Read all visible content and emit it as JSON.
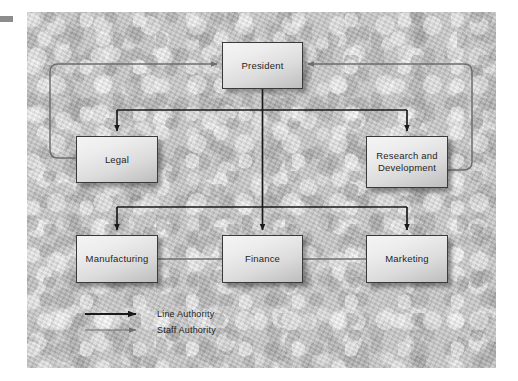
{
  "diagram": {
    "type": "organizational-chart",
    "background_color": "#c8c8c8",
    "box_border_color": "#3a3a3a",
    "line_authority_color": "#1a1a1a",
    "staff_authority_color": "#6e6e6e",
    "nodes": [
      {
        "id": "president",
        "label": "President",
        "level": 1,
        "x": 222,
        "y": 42,
        "w": 81,
        "h": 47
      },
      {
        "id": "legal",
        "label": "Legal",
        "level": 2,
        "x": 76,
        "y": 136,
        "w": 82,
        "h": 47
      },
      {
        "id": "rd",
        "label": "Research and\nDevelopment",
        "level": 2,
        "x": 366,
        "y": 136,
        "w": 82,
        "h": 52
      },
      {
        "id": "manufacturing",
        "label": "Manufacturing",
        "level": 3,
        "x": 76,
        "y": 235,
        "w": 82,
        "h": 48
      },
      {
        "id": "finance",
        "label": "Finance",
        "level": 3,
        "x": 222,
        "y": 235,
        "w": 81,
        "h": 48
      },
      {
        "id": "marketing",
        "label": "Marketing",
        "level": 3,
        "x": 366,
        "y": 235,
        "w": 82,
        "h": 48
      }
    ],
    "edges": [
      {
        "from": "president",
        "to": "legal",
        "authority": "line"
      },
      {
        "from": "president",
        "to": "rd",
        "authority": "line"
      },
      {
        "from": "president",
        "to": "manufacturing",
        "authority": "line"
      },
      {
        "from": "president",
        "to": "finance",
        "authority": "line"
      },
      {
        "from": "president",
        "to": "marketing",
        "authority": "line"
      },
      {
        "from": "legal",
        "to": "president",
        "authority": "staff"
      },
      {
        "from": "rd",
        "to": "president",
        "authority": "staff"
      },
      {
        "from": "manufacturing",
        "to": "finance",
        "authority": "staff"
      },
      {
        "from": "finance",
        "to": "marketing",
        "authority": "staff"
      }
    ]
  },
  "legend": {
    "items": [
      {
        "key": "line",
        "label": "Line Authority",
        "color": "#1a1a1a",
        "thickness": "thick"
      },
      {
        "key": "staff",
        "label": "Staff Authority",
        "color": "#6e6e6e",
        "thickness": "thin"
      }
    ]
  }
}
